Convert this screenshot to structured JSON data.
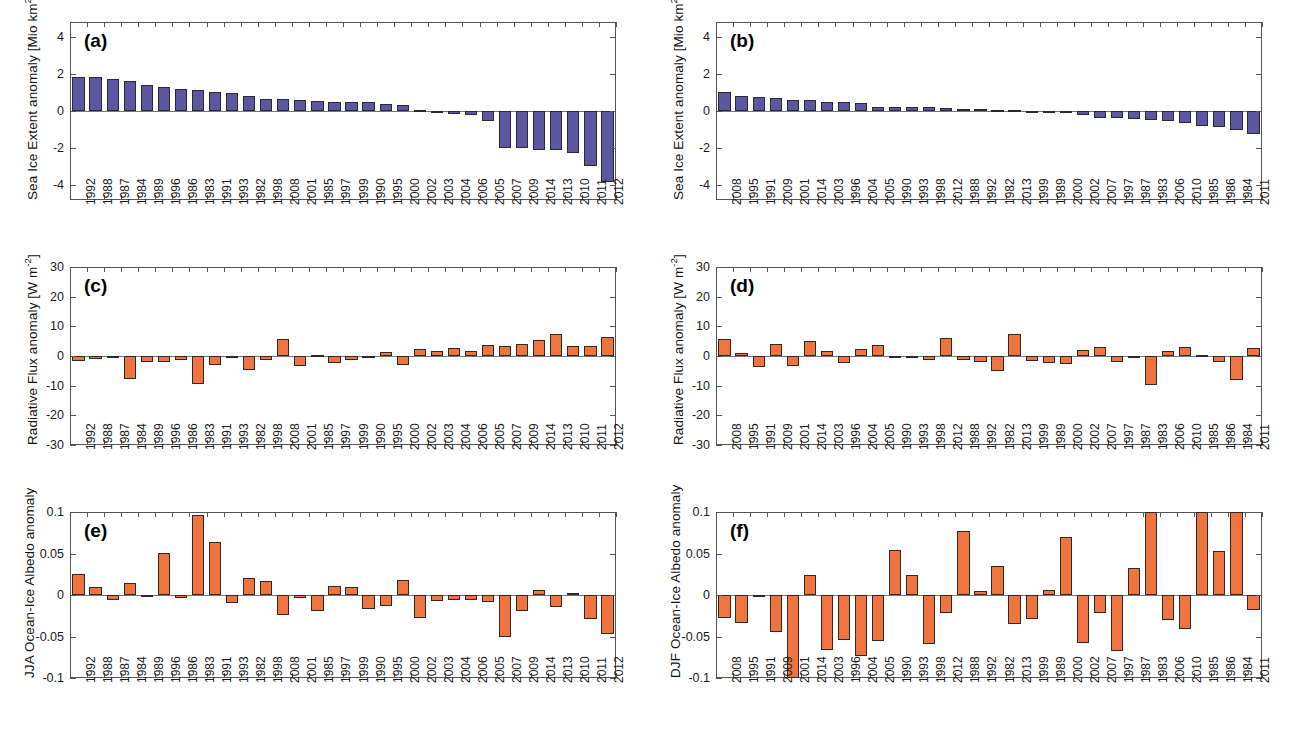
{
  "figure": {
    "title": "",
    "panel_count": 6,
    "colors": {
      "sea_ice_bar": "#5d56a3",
      "flux_bar": "#f0743e",
      "albedo_bar": "#f0743e",
      "axis": "#555555"
    }
  },
  "chart_data": [
    {
      "id": "a",
      "type": "bar",
      "tag": "(a)",
      "title": "",
      "xlabel": "",
      "ylabel": "Sea Ice Extent anomaly [Mio km²]",
      "ylabel_parts": {
        "text": "Sea Ice Extent anomaly [Mio km",
        "sup": "2",
        "tail": "]"
      },
      "ylim": [
        -4.8,
        4.8
      ],
      "yticks": [
        4,
        2,
        0,
        -2,
        -4
      ],
      "ytick_labels": [
        "4",
        "2",
        "0",
        "-2",
        "-4"
      ],
      "grid": false,
      "legend": "none",
      "bar_color": "#5d56a3",
      "categories": [
        "1992",
        "1988",
        "1987",
        "1984",
        "1989",
        "1996",
        "1986",
        "1983",
        "1991",
        "1993",
        "1982",
        "1998",
        "2008",
        "2001",
        "1985",
        "1997",
        "1999",
        "1990",
        "1995",
        "2000",
        "2002",
        "2003",
        "2004",
        "2006",
        "2005",
        "2007",
        "2009",
        "2014",
        "2013",
        "2010",
        "2011",
        "2012"
      ],
      "values": [
        1.85,
        1.82,
        1.72,
        1.62,
        1.4,
        1.3,
        1.16,
        1.13,
        1.0,
        0.95,
        0.82,
        0.65,
        0.65,
        0.58,
        0.52,
        0.5,
        0.48,
        0.46,
        0.38,
        0.3,
        0.07,
        -0.04,
        -0.16,
        -0.2,
        -0.55,
        -1.98,
        -2.02,
        -2.08,
        -2.1,
        -2.25,
        -2.95,
        -3.82
      ]
    },
    {
      "id": "b",
      "type": "bar",
      "tag": "(b)",
      "title": "",
      "xlabel": "",
      "ylabel": "Sea Ice Extent anomaly [Mio km²]",
      "ylabel_parts": {
        "text": "Sea Ice Extent anomaly [Mio km",
        "sup": "2",
        "tail": "]"
      },
      "ylim": [
        -4.8,
        4.8
      ],
      "yticks": [
        4,
        2,
        0,
        -2,
        -4
      ],
      "ytick_labels": [
        "4",
        "2",
        "0",
        "-2",
        "-4"
      ],
      "grid": false,
      "legend": "none",
      "bar_color": "#5d56a3",
      "categories": [
        "2008",
        "1995",
        "1991",
        "2009",
        "2001",
        "2014",
        "2003",
        "1996",
        "2004",
        "2005",
        "1990",
        "1993",
        "1998",
        "2012",
        "1988",
        "1992",
        "1982",
        "2013",
        "1999",
        "1989",
        "2000",
        "2002",
        "2007",
        "1997",
        "1987",
        "1983",
        "2006",
        "2010",
        "1985",
        "1986",
        "1984",
        "2011"
      ],
      "values": [
        1.02,
        0.8,
        0.76,
        0.68,
        0.62,
        0.6,
        0.5,
        0.48,
        0.42,
        0.22,
        0.21,
        0.2,
        0.19,
        0.14,
        0.13,
        0.11,
        0.08,
        0.06,
        0.02,
        0.01,
        -0.02,
        -0.2,
        -0.38,
        -0.4,
        -0.44,
        -0.48,
        -0.56,
        -0.66,
        -0.82,
        -0.86,
        -1.0,
        -1.22
      ]
    },
    {
      "id": "c",
      "type": "bar",
      "tag": "(c)",
      "title": "",
      "xlabel": "",
      "ylabel": "Radiative Flux anomaly [W m⁻²]",
      "ylabel_parts": {
        "text": "Radiative Flux anomaly [W m",
        "sup": "-2",
        "tail": "]"
      },
      "ylim": [
        -30,
        30
      ],
      "yticks": [
        30,
        20,
        10,
        0,
        -10,
        -20,
        -30
      ],
      "ytick_labels": [
        "30",
        "20",
        "10",
        "0",
        "-10",
        "-20",
        "-30"
      ],
      "grid": false,
      "legend": "none",
      "bar_color": "#f0743e",
      "categories": [
        "1992",
        "1988",
        "1987",
        "1984",
        "1989",
        "1996",
        "1986",
        "1983",
        "1991",
        "1993",
        "1982",
        "1998",
        "2008",
        "2001",
        "1985",
        "1997",
        "1999",
        "1990",
        "1995",
        "2000",
        "2002",
        "2003",
        "2004",
        "2006",
        "2005",
        "2007",
        "2009",
        "2014",
        "2013",
        "2010",
        "2011",
        "2012"
      ],
      "values": [
        -1.8,
        -1.1,
        -0.3,
        -7.7,
        -2.0,
        -2.1,
        -1.5,
        -9.4,
        -3.0,
        -0.4,
        -4.8,
        -1.2,
        5.8,
        -3.3,
        0.3,
        -2.2,
        -1.5,
        -0.2,
        1.2,
        -3.0,
        2.4,
        1.7,
        2.6,
        1.7,
        3.6,
        3.3,
        4.0,
        5.4,
        7.4,
        3.3,
        3.3,
        6.3
      ]
    },
    {
      "id": "d",
      "type": "bar",
      "tag": "(d)",
      "title": "",
      "xlabel": "",
      "ylabel": "Radiative Flux anomaly [W m⁻²]",
      "ylabel_parts": {
        "text": "Radiative Flux anomaly [W m",
        "sup": "-2",
        "tail": "]"
      },
      "ylim": [
        -30,
        30
      ],
      "yticks": [
        30,
        20,
        10,
        0,
        -10,
        -20,
        -30
      ],
      "ytick_labels": [
        "30",
        "20",
        "10",
        "0",
        "-10",
        "-20",
        "-30"
      ],
      "grid": false,
      "legend": "none",
      "bar_color": "#f0743e",
      "categories": [
        "2008",
        "1995",
        "1991",
        "2009",
        "2001",
        "2014",
        "2003",
        "1996",
        "2004",
        "2005",
        "1990",
        "1993",
        "1998",
        "2012",
        "1988",
        "1992",
        "1982",
        "2013",
        "1999",
        "1989",
        "2000",
        "2002",
        "2007",
        "1997",
        "1987",
        "1983",
        "2006",
        "2010",
        "1985",
        "1986",
        "1984",
        "2011"
      ],
      "values": [
        5.7,
        1.1,
        -3.7,
        3.9,
        -3.3,
        5.2,
        1.7,
        -2.5,
        2.4,
        3.6,
        -0.2,
        -0.2,
        -1.3,
        6.2,
        -1.4,
        -2.1,
        -5.2,
        7.3,
        -1.6,
        -2.5,
        -2.8,
        2.1,
        3.1,
        -2.1,
        -0.3,
        -9.8,
        1.6,
        3.1,
        0.3,
        -1.9,
        -8.0,
        2.8
      ]
    },
    {
      "id": "e",
      "type": "bar",
      "tag": "(e)",
      "title": "",
      "xlabel": "",
      "ylabel": "JJA Ocean-Ice Albedo anomaly",
      "ylabel_parts": {
        "text": "JJA Ocean-Ice Albedo anomaly",
        "sup": "",
        "tail": ""
      },
      "ylim": [
        -0.1,
        0.1
      ],
      "yticks": [
        0.1,
        0.05,
        0,
        -0.05,
        -0.1
      ],
      "ytick_labels": [
        "0.1",
        "0.05",
        "0",
        "-0.05",
        "-0.1"
      ],
      "grid": false,
      "legend": "none",
      "bar_color": "#f0743e",
      "categories": [
        "1992",
        "1988",
        "1987",
        "1984",
        "1989",
        "1996",
        "1986",
        "1983",
        "1991",
        "1993",
        "1982",
        "1998",
        "2008",
        "2001",
        "1985",
        "1997",
        "1999",
        "1990",
        "1995",
        "2000",
        "2002",
        "2003",
        "2004",
        "2006",
        "2005",
        "2007",
        "2009",
        "2014",
        "2013",
        "2010",
        "2011",
        "2012"
      ],
      "values": [
        0.0255,
        0.01,
        -0.0055,
        0.0145,
        -0.0015,
        0.051,
        -0.004,
        0.096,
        0.0635,
        -0.0095,
        0.021,
        0.0165,
        -0.0235,
        -0.0035,
        -0.019,
        0.011,
        0.01,
        -0.017,
        -0.0135,
        0.018,
        -0.028,
        -0.0075,
        -0.0055,
        -0.006,
        -0.008,
        -0.051,
        -0.0195,
        0.0055,
        -0.015,
        0.003,
        -0.0285,
        -0.0465
      ]
    },
    {
      "id": "f",
      "type": "bar",
      "tag": "(f)",
      "title": "",
      "xlabel": "",
      "ylabel": "DJF Ocean-Ice Albedo anomaly",
      "ylabel_parts": {
        "text": "DJF Ocean-Ice Albedo anomaly",
        "sup": "",
        "tail": ""
      },
      "ylim": [
        -0.1,
        0.1
      ],
      "yticks": [
        0.1,
        0.05,
        0,
        -0.05,
        -0.1
      ],
      "ytick_labels": [
        "0.1",
        "0.05",
        "0",
        "-0.05",
        "-0.1"
      ],
      "grid": false,
      "legend": "none",
      "bar_color": "#f0743e",
      "categories": [
        "2008",
        "1995",
        "1991",
        "2009",
        "2001",
        "2014",
        "2003",
        "1996",
        "2004",
        "2005",
        "1990",
        "1993",
        "1998",
        "2012",
        "1988",
        "1992",
        "1982",
        "2013",
        "1999",
        "1989",
        "2000",
        "2002",
        "2007",
        "1997",
        "1987",
        "1983",
        "2006",
        "2010",
        "1985",
        "1986",
        "1984",
        "2011"
      ],
      "values": [
        -0.0275,
        -0.034,
        -0.002,
        -0.045,
        -0.1,
        0.0245,
        -0.066,
        -0.0545,
        -0.074,
        -0.055,
        0.054,
        0.024,
        -0.059,
        -0.0215,
        0.0775,
        0.0045,
        0.0355,
        -0.035,
        -0.029,
        0.0055,
        0.07,
        -0.0575,
        -0.022,
        -0.067,
        0.033,
        0.1,
        -0.0305,
        -0.0405,
        0.1,
        0.0535,
        0.1,
        -0.018
      ]
    }
  ]
}
